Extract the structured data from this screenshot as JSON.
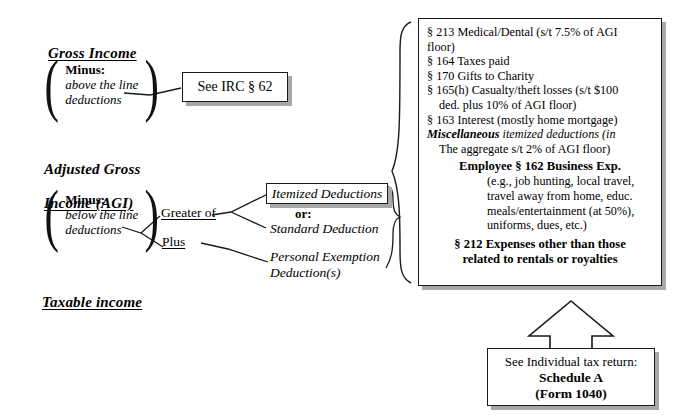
{
  "diagram": {
    "title_flow": "Individual income tax computation flow",
    "stages": [
      {
        "id": "gross-income",
        "label": "Gross Income"
      },
      {
        "id": "adjusted-gross-income",
        "line1": "Adjusted Gross",
        "line2": "Income (AGI)"
      },
      {
        "id": "taxable-income",
        "label": "Taxable income"
      }
    ],
    "minus_groups": [
      {
        "id": "above-the-line",
        "keyword": "Minus:",
        "line1": "above the line",
        "line2": "deductions"
      },
      {
        "id": "below-the-line",
        "keyword": "Minus:",
        "line1": "below the line",
        "line2": "deductions"
      }
    ],
    "branch_labels": {
      "greater_of": "Greater of",
      "plus": "Plus"
    },
    "choices": {
      "itemized_box": "Itemized Deductions",
      "or": "or:",
      "standard": "Standard Deduction",
      "personal_exemption_line1": "Personal Exemption",
      "personal_exemption_line2": "Deduction(s)"
    },
    "irc_box": "See IRC § 62",
    "schedule_box": {
      "line1": "See Individual tax return:",
      "line2": "Schedule A",
      "line3": "(Form 1040)"
    },
    "deductions_panel": {
      "items": [
        {
          "id": "sec-213",
          "text": "§ 213 Medical/Dental (s/t 7.5% of AGI",
          "cont": "floor)"
        },
        {
          "id": "sec-164",
          "text": "§ 164 Taxes paid"
        },
        {
          "id": "sec-170",
          "text": "§ 170 Gifts to Charity"
        },
        {
          "id": "sec-165h",
          "text": "§ 165(h) Casualty/theft losses (s/t $100",
          "cont": "ded. plus 10% of AGI floor)"
        },
        {
          "id": "sec-163",
          "text": "§ 163 Interest (mostly home mortgage)"
        }
      ],
      "misc_bold": "Miscellaneous",
      "misc_rest": " itemized deductions (in",
      "misc_cont": "The aggregate s/t 2% of AGI floor)",
      "employee_heading": "Employee  § 162 Business Exp.",
      "employee_examples": [
        "(e.g., job hunting, local travel,",
        "travel away from home, educ.",
        "meals/entertainment (at 50%),",
        "uniforms, dues, etc.)"
      ],
      "sec_212_line1": "§ 212 Expenses other than those",
      "sec_212_line2": "related to rentals or royalties"
    }
  },
  "colors": {
    "ink": "#000000",
    "shadow": "#a8a8a8",
    "background": "#ffffff"
  }
}
